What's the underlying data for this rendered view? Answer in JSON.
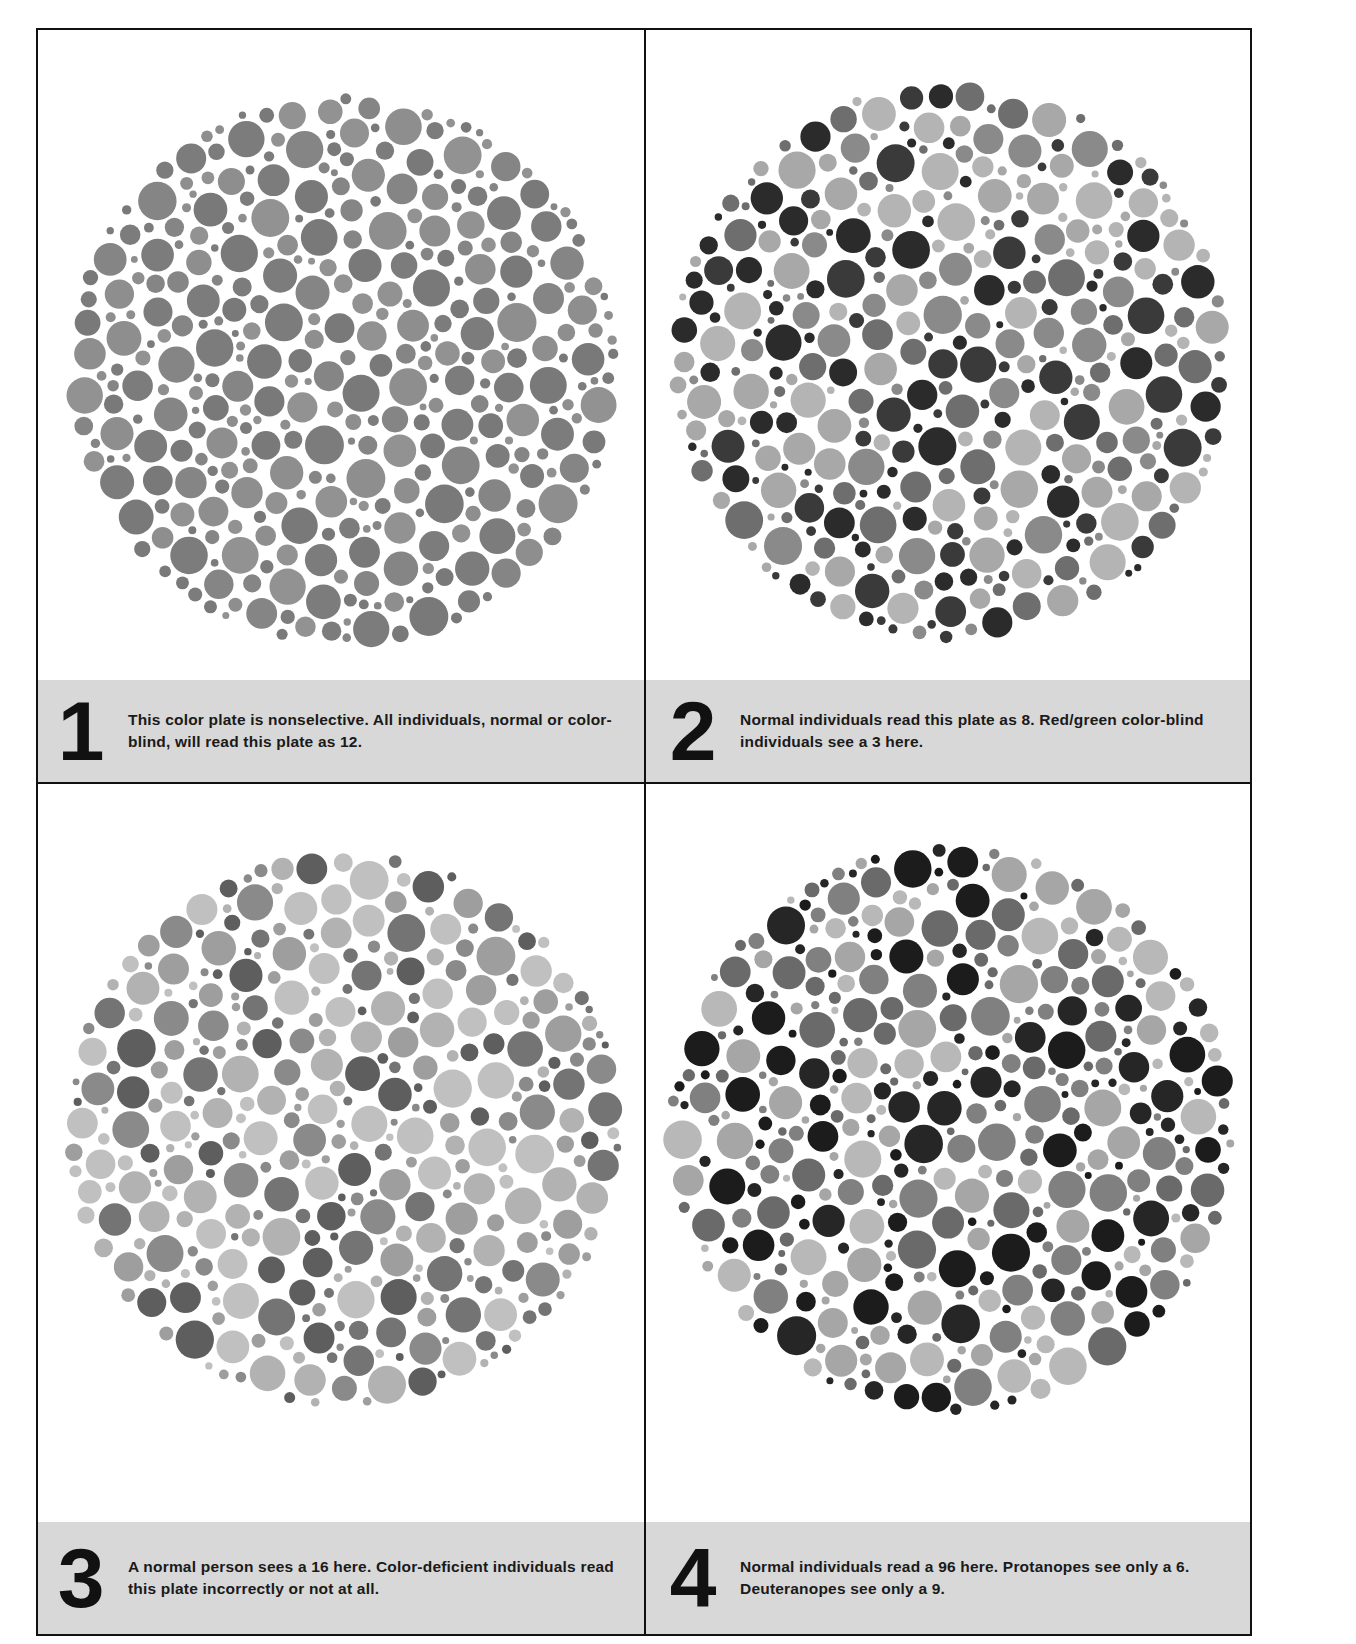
{
  "figure": {
    "background": "#ffffff",
    "caption_band_color": "#d8d8d8",
    "border_color": "#111111"
  },
  "plates": [
    {
      "number": "1",
      "caption": "This color plate is nonselective. All individuals, normal or color-blind, will read this plate as 12.",
      "hidden_figure_normal": "12",
      "palette": [
        "#7c7c7c",
        "#858585",
        "#8e8e8e",
        "#797979",
        "#929292"
      ],
      "center": [
        305,
        340
      ],
      "radius": 278,
      "seed": 11
    },
    {
      "number": "2",
      "caption": "Normal individuals read this plate as 8. Red/green color-blind individuals see a 3 here.",
      "hidden_figure_normal": "8",
      "hidden_figure_colorblind": "3",
      "palette": [
        "#2b2b2b",
        "#3a3a3a",
        "#6e6e6e",
        "#8a8a8a",
        "#a8a8a8",
        "#b4b4b4"
      ],
      "center": [
        305,
        332
      ],
      "radius": 282,
      "seed": 23
    },
    {
      "number": "3",
      "caption": "A normal person sees a 16 here. Color-deficient individuals read this plate incorrectly or not at all.",
      "hidden_figure_normal": "16",
      "palette": [
        "#5e5e5e",
        "#747474",
        "#8a8a8a",
        "#9e9e9e",
        "#b2b2b2",
        "#c0c0c0"
      ],
      "center": [
        305,
        345
      ],
      "radius": 280,
      "seed": 37
    },
    {
      "number": "4",
      "caption": "Normal individuals read a 96 here. Protanopes see only a 6. Deuteranopes see only a 9.",
      "hidden_figure_normal": "96",
      "hidden_figure_protanope": "6",
      "hidden_figure_deuteranope": "9",
      "palette": [
        "#1c1c1c",
        "#262626",
        "#6a6a6a",
        "#808080",
        "#a6a6a6",
        "#b8b8b8"
      ],
      "center": [
        305,
        345
      ],
      "radius": 286,
      "seed": 53
    }
  ]
}
